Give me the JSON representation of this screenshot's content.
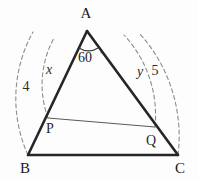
{
  "figure": {
    "kind": "geometry-diagram",
    "background_color": "#fdfdfd",
    "stroke_color": "#262626",
    "thin_stroke_color": "#5a5a5a",
    "dashed_stroke_color": "#8c8c8c"
  },
  "vertices": {
    "a": {
      "label": "A",
      "x": 87,
      "y": 31,
      "label_x": 86,
      "label_y": 18
    },
    "b": {
      "label": "B",
      "x": 28,
      "y": 155,
      "label_x": 25,
      "label_y": 173
    },
    "c": {
      "label": "C",
      "x": 178,
      "y": 155,
      "label_x": 180,
      "label_y": 173
    }
  },
  "points": {
    "p": {
      "label": "P",
      "x": 48,
      "y": 118,
      "label_x": 50,
      "label_y": 133
    },
    "q": {
      "label": "Q",
      "x": 155,
      "y": 127,
      "label_x": 151,
      "label_y": 145
    }
  },
  "angles": {
    "apex": {
      "value": "60",
      "degree_symbol": "◦",
      "label_x": 78,
      "label_y": 62
    }
  },
  "measure_labels": [
    {
      "name": "ap-length",
      "text": "x",
      "style": "italic",
      "x": 49,
      "y": 74
    },
    {
      "name": "ab-length",
      "text": "4",
      "style": "upright",
      "x": 26,
      "y": 91
    },
    {
      "name": "aq-length",
      "text": "y",
      "style": "italic",
      "x": 140,
      "y": 76
    },
    {
      "name": "ac-length",
      "text": "5",
      "style": "upright",
      "x": 155,
      "y": 75
    }
  ],
  "arcs": {
    "ap_arc": {
      "name": "arc-a-to-p",
      "label": "x"
    },
    "ab_arc": {
      "name": "arc-a-to-b",
      "label": "4"
    },
    "aq_arc": {
      "name": "arc-a-to-q",
      "label": "y"
    },
    "ac_arc": {
      "name": "arc-a-to-c",
      "label": "5"
    }
  },
  "segments": {
    "ab": {
      "name": "side-ab"
    },
    "ac": {
      "name": "side-ac"
    },
    "bc": {
      "name": "side-bc"
    },
    "pq": {
      "name": "segment-pq"
    }
  }
}
